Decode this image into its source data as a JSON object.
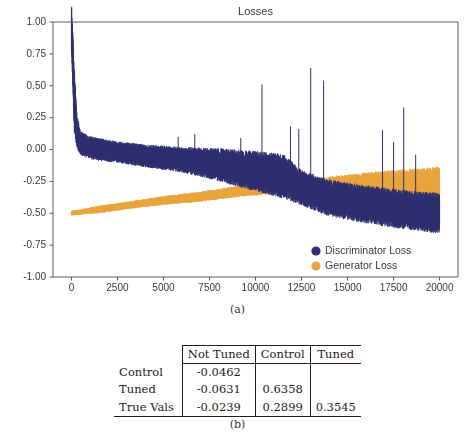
{
  "figure": {
    "subfigure_a_caption": "(a)",
    "subfigure_b_caption": "(b)"
  },
  "chart_data": {
    "type": "line",
    "xlabel": "",
    "ylabel": "",
    "xlim": [
      -1000,
      21000
    ],
    "ylim": [
      -1.0,
      1.0
    ],
    "xticks": [
      0,
      2500,
      5000,
      7500,
      10000,
      12500,
      15000,
      17500,
      20000
    ],
    "xtick_labels": [
      "0",
      "2500",
      "5000",
      "7500",
      "10000",
      "12500",
      "15000",
      "17500",
      "20000"
    ],
    "yticks": [
      -1.0,
      -0.75,
      -0.5,
      -0.25,
      0.0,
      0.25,
      0.5,
      0.75,
      1.0
    ],
    "ytick_labels": [
      "-1.00",
      "-0.75",
      "-0.50",
      "-0.25",
      "0.00",
      "0.25",
      "0.50",
      "0.75",
      "1.00"
    ],
    "grid": false,
    "legend_position": "lower right",
    "colors": {
      "discriminator": "#2f3070",
      "generator": "#e8a53f",
      "axis": "#5a5a5a",
      "text": "#3a3a3a"
    },
    "series": [
      {
        "name": "Discriminator Loss",
        "color": "#2f3070",
        "key": "discriminator",
        "description": "Starts near 1.00, decays sharply to about 0.05 by step 500, drifts slowly downward, crossing the generator trace near step 10500, ending near -0.50 with noise band widening to roughly -0.65.",
        "envelope_x": [
          0,
          150,
          300,
          500,
          900,
          1500,
          2500,
          4000,
          6000,
          8000,
          10000,
          11500,
          12500,
          14000,
          16000,
          18000,
          20000
        ],
        "envelope_center": [
          0.98,
          0.4,
          0.14,
          0.05,
          0.02,
          0.0,
          -0.02,
          -0.05,
          -0.08,
          -0.12,
          -0.17,
          -0.21,
          -0.3,
          -0.38,
          -0.43,
          -0.47,
          -0.5
        ],
        "envelope_upper": [
          1.0,
          0.62,
          0.3,
          0.17,
          0.14,
          0.12,
          0.09,
          0.07,
          0.06,
          0.07,
          0.08,
          0.05,
          -0.16,
          -0.23,
          -0.26,
          -0.29,
          -0.32
        ],
        "envelope_lower": [
          0.6,
          0.1,
          0.02,
          -0.02,
          -0.04,
          -0.06,
          -0.08,
          -0.11,
          -0.14,
          -0.19,
          -0.24,
          -0.3,
          -0.44,
          -0.52,
          -0.56,
          -0.6,
          -0.64
        ],
        "spikes": [
          {
            "x": 10350,
            "y": 0.51
          },
          {
            "x": 13000,
            "y": 0.64
          },
          {
            "x": 13700,
            "y": 0.54
          },
          {
            "x": 11900,
            "y": 0.18
          },
          {
            "x": 12350,
            "y": 0.16
          },
          {
            "x": 16900,
            "y": 0.15
          },
          {
            "x": 17500,
            "y": 0.06
          },
          {
            "x": 18050,
            "y": 0.33
          },
          {
            "x": 18700,
            "y": -0.04
          },
          {
            "x": 5800,
            "y": 0.1
          },
          {
            "x": 6700,
            "y": 0.12
          },
          {
            "x": 9200,
            "y": 0.09
          }
        ]
      },
      {
        "name": "Generator Loss",
        "color": "#e8a53f",
        "key": "generator",
        "description": "Starts near -0.50, rises steadily and nearly linearly, crossing the discriminator trace near step 10500, ending near -0.20 with a widening noise band.",
        "envelope_x": [
          0,
          500,
          1500,
          3000,
          5000,
          7000,
          9000,
          10500,
          12000,
          13500,
          15000,
          17000,
          19000,
          20000
        ],
        "envelope_center": [
          -0.5,
          -0.49,
          -0.47,
          -0.44,
          -0.4,
          -0.37,
          -0.33,
          -0.31,
          -0.3,
          -0.29,
          -0.28,
          -0.27,
          -0.26,
          -0.26
        ],
        "envelope_upper": [
          -0.48,
          -0.47,
          -0.44,
          -0.41,
          -0.37,
          -0.33,
          -0.29,
          -0.27,
          -0.25,
          -0.23,
          -0.21,
          -0.19,
          -0.18,
          -0.17
        ],
        "envelope_lower": [
          -0.52,
          -0.51,
          -0.5,
          -0.47,
          -0.44,
          -0.41,
          -0.38,
          -0.36,
          -0.36,
          -0.37,
          -0.38,
          -0.4,
          -0.41,
          -0.42
        ]
      }
    ],
    "legend": [
      {
        "label": "Discriminator Loss",
        "color": "#2f3070"
      },
      {
        "label": "Generator Loss",
        "color": "#e8a53f"
      }
    ]
  },
  "results_table": {
    "corner_label": "",
    "columns": [
      "Not Tuned",
      "Control",
      "Tuned"
    ],
    "rows": [
      {
        "label": "Control",
        "values": [
          "-0.0462",
          "",
          ""
        ]
      },
      {
        "label": "Tuned",
        "values": [
          "-0.0631",
          "0.6358",
          ""
        ]
      },
      {
        "label": "True Vals",
        "values": [
          "-0.0239",
          "0.2899",
          "0.3545"
        ]
      }
    ]
  }
}
